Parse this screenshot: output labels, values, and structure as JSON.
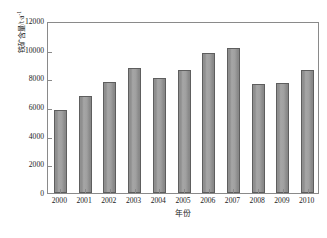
{
  "chart_data": {
    "type": "bar",
    "title": "",
    "xlabel": "年份",
    "ylabel": "铁矿含量/t·a",
    "ylabel_exponent": "-1",
    "categories": [
      "2000",
      "2001",
      "2002",
      "2003",
      "2004",
      "2005",
      "2006",
      "2007",
      "2008",
      "2009",
      "2010"
    ],
    "values": [
      5800,
      6800,
      7750,
      8750,
      8050,
      8600,
      9800,
      10100,
      7600,
      7650,
      8600
    ],
    "ylim": [
      0,
      12000
    ],
    "ytick_labels": [
      "0",
      "2000",
      "4000",
      "6000",
      "8000",
      "10000",
      "12000"
    ],
    "ytick_values": [
      0,
      2000,
      4000,
      6000,
      8000,
      10000,
      12000
    ],
    "grid": false,
    "legend": null,
    "series_name": "铁矿含量",
    "bar_color": "#969696",
    "bar_edge_color": "#5e5e5e",
    "frame_color": "#8a8a8a",
    "background": "#ffffff"
  }
}
